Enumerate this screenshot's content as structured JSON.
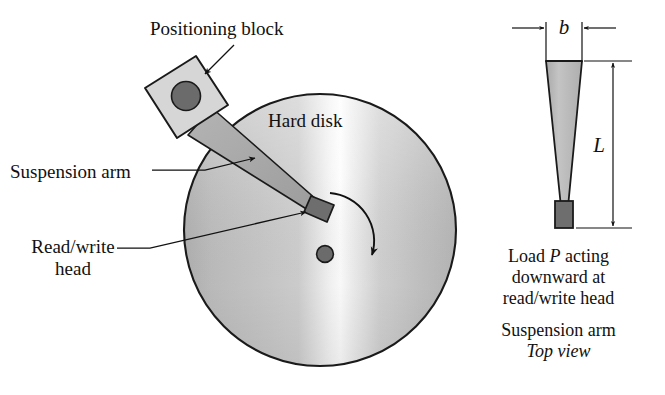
{
  "figure": {
    "type": "engineering-diagram",
    "labels": {
      "positioning_block": "Positioning block",
      "suspension_arm": "Suspension arm",
      "read_write_head_line1": "Read/write",
      "read_write_head_line2": "head",
      "hard_disk": "Hard disk"
    },
    "right_panel": {
      "dimension_b": "b",
      "dimension_L": "L",
      "caption_load_line1_pre": "Load ",
      "caption_load_line1_var": "P",
      "caption_load_line1_post": " acting",
      "caption_load_line2": "downward at",
      "caption_load_line3": "read/write head",
      "caption_view_line1": "Suspension arm",
      "caption_view_line2": "Top view"
    },
    "colors": {
      "ink": "#111111",
      "outline": "#1a1a1a",
      "disk_light": "#fbfbfb",
      "disk_mid": "#c2c2c2",
      "disk_dark": "#a9a9a9",
      "block_fill": "#d4d4d4",
      "arm_fill": "#a8a8a8",
      "head_fill": "#6e6e6e",
      "pivot_fill": "#6b6b6b",
      "taper_fill": "#b9b9b9",
      "background": "#ffffff"
    },
    "geometry": {
      "disk_center_x": 320,
      "disk_center_y": 230,
      "disk_radius": 136,
      "spindle_radius": 8,
      "rotation_direction": "clockwise"
    }
  }
}
